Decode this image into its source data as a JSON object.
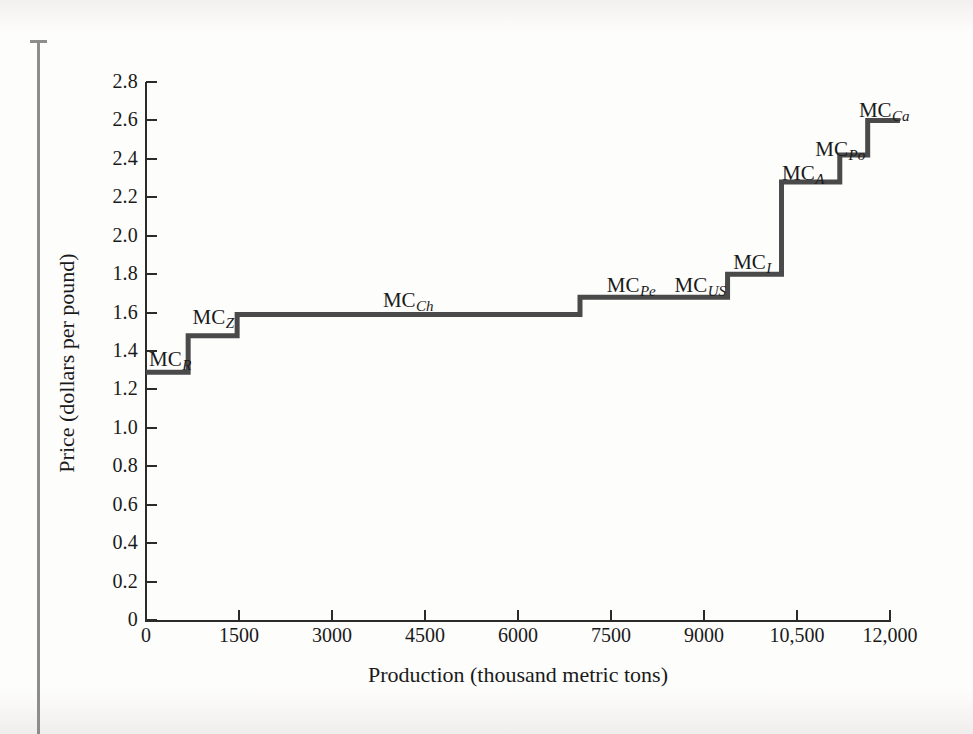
{
  "figure": {
    "x_axis_title": "Production (thousand metric tons)",
    "y_axis_title": "Price (dollars per pound)"
  },
  "chart_data": {
    "type": "line",
    "subtype": "step",
    "title": "",
    "xlabel": "Production (thousand metric tons)",
    "ylabel": "Price (dollars per pound)",
    "xlim": [
      0,
      12000
    ],
    "ylim": [
      0,
      2.8
    ],
    "grid": false,
    "legend": "none",
    "x_ticks": [
      0,
      1500,
      3000,
      4500,
      6000,
      7500,
      9000,
      10500,
      12000
    ],
    "x_tick_labels": [
      "0",
      "1500",
      "3000",
      "4500",
      "6000",
      "7500",
      "9000",
      "10,500",
      "12,000"
    ],
    "y_ticks": [
      0,
      0.2,
      0.4,
      0.6,
      0.8,
      1.0,
      1.2,
      1.4,
      1.6,
      1.8,
      2.0,
      2.2,
      2.4,
      2.6,
      2.8
    ],
    "y_tick_labels": [
      "0",
      "0.2",
      "0.4",
      "0.6",
      "0.8",
      "1.0",
      "1.2",
      "1.4",
      "1.6",
      "1.8",
      "2.0",
      "2.2",
      "2.4",
      "2.6",
      "2.8"
    ],
    "line_color": "#4a4a4a",
    "steps": [
      {
        "label": "MC",
        "sub": "R",
        "x_start": 0,
        "x_end": 680,
        "price": 1.29,
        "label_x": 170,
        "label_y": 349
      },
      {
        "label": "MC",
        "sub": "Z",
        "x_start": 680,
        "x_end": 1470,
        "price": 1.48,
        "label_x": 213,
        "label_y": 307
      },
      {
        "label": "MC",
        "sub": "Ch",
        "x_start": 1470,
        "x_end": 7000,
        "price": 1.59,
        "label_x": 408,
        "label_y": 290
      },
      {
        "label": "MC",
        "sub": "Pe",
        "x_start": 7000,
        "x_end": 8200,
        "price": 1.68,
        "label_x": 631,
        "label_y": 275
      },
      {
        "label": "MC",
        "sub": "US",
        "x_start": 8200,
        "x_end": 9380,
        "price": 1.68,
        "label_x": 700,
        "label_y": 275
      },
      {
        "label": "MC",
        "sub": "I",
        "x_start": 9380,
        "x_end": 10250,
        "price": 1.8,
        "label_x": 752,
        "label_y": 252
      },
      {
        "label": "MC",
        "sub": "A",
        "x_start": 10250,
        "x_end": 11190,
        "price": 2.28,
        "label_x": 803,
        "label_y": 163
      },
      {
        "label": "MC",
        "sub": "Po",
        "x_start": 11190,
        "x_end": 11640,
        "price": 2.42,
        "label_x": 840,
        "label_y": 139
      },
      {
        "label": "MC",
        "sub": "Ca",
        "x_start": 11640,
        "x_end": 12160,
        "price": 2.6,
        "label_x": 884,
        "label_y": 100
      }
    ]
  }
}
